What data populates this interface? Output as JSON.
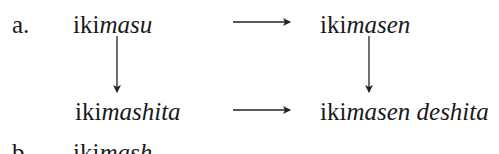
{
  "example": {
    "label": "a.",
    "top_left": {
      "stem": "iki",
      "suffix": "masu"
    },
    "top_right": {
      "stem": "iki",
      "suffix": "masen"
    },
    "bottom_left": {
      "stem": "iki",
      "suffix": "mashita"
    },
    "bottom_right": {
      "stem": "iki",
      "suffix": "masen deshita"
    }
  },
  "next_example": {
    "label": "b.",
    "stem": "iki",
    "suffix": "mash"
  },
  "arrows": [
    {
      "from": "top_left",
      "to": "top_right",
      "direction": "right"
    },
    {
      "from": "top_left",
      "to": "bottom_left",
      "direction": "down"
    },
    {
      "from": "top_right",
      "to": "bottom_right",
      "direction": "down"
    },
    {
      "from": "bottom_left",
      "to": "bottom_right",
      "direction": "right"
    }
  ]
}
